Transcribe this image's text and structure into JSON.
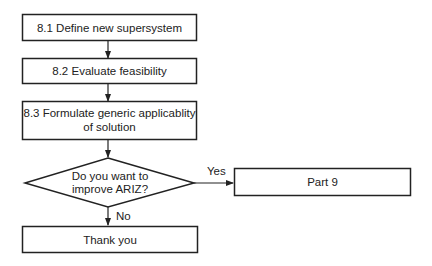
{
  "diagram": {
    "type": "flowchart",
    "nodes": [
      {
        "id": "n81",
        "shape": "rect",
        "lines": [
          "8.1 Define new supersystem"
        ]
      },
      {
        "id": "n82",
        "shape": "rect",
        "lines": [
          "8.2 Evaluate feasibility"
        ]
      },
      {
        "id": "n83",
        "shape": "rect",
        "lines": [
          "8.3 Formulate generic applicablity",
          "of solution"
        ]
      },
      {
        "id": "decision",
        "shape": "diamond",
        "lines": [
          "Do you want to",
          "improve ARIZ?"
        ]
      },
      {
        "id": "part9",
        "shape": "rect",
        "lines": [
          "Part 9"
        ]
      },
      {
        "id": "thanks",
        "shape": "rect",
        "lines": [
          "Thank you"
        ]
      }
    ],
    "edges": [
      {
        "from": "n81",
        "to": "n82",
        "label": ""
      },
      {
        "from": "n82",
        "to": "n83",
        "label": ""
      },
      {
        "from": "n83",
        "to": "decision",
        "label": ""
      },
      {
        "from": "decision",
        "to": "part9",
        "label": "Yes"
      },
      {
        "from": "decision",
        "to": "thanks",
        "label": "No"
      }
    ]
  },
  "colors": {
    "stroke": "#222222",
    "background": "#ffffff",
    "text": "#222222"
  }
}
